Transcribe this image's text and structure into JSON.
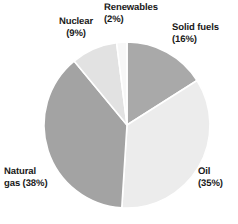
{
  "chart_data": {
    "type": "pie",
    "title": "",
    "subtitle": "",
    "xlabel": "",
    "ylabel": "",
    "legend_position": "none",
    "grid": false,
    "labels_outside": true,
    "start_angle_deg": 0,
    "direction": "clockwise",
    "categories": [
      "Solid fuels",
      "Oil",
      "Natural gas",
      "Nuclear",
      "Renewables"
    ],
    "values": [
      16,
      35,
      38,
      9,
      2
    ],
    "unit": "%",
    "slices": [
      {
        "name": "Solid fuels",
        "value": 16,
        "label": "Solid fuels\n(16%)",
        "label_name": "Solid fuels",
        "label_value": "(16%)",
        "color": "#a9a9a9"
      },
      {
        "name": "Oil",
        "value": 35,
        "label": "Oil\n(35%)",
        "label_name": "Oil",
        "label_value": "(35%)",
        "color": "#ececec"
      },
      {
        "name": "Natural gas",
        "value": 38,
        "label": "Natural\ngas (38%)",
        "label_name": "Natural gas",
        "label_value": "(38%)",
        "color": "#a3a3a3"
      },
      {
        "name": "Nuclear",
        "value": 9,
        "label": "Nuclear\n(9%)",
        "label_name": "Nuclear",
        "label_value": "(9%)",
        "color": "#e2e2e2"
      },
      {
        "name": "Renewables",
        "value": 2,
        "label": "Renewables\n(2%)",
        "label_name": "Renewables",
        "label_value": "(2%)",
        "color": "#f7f7f7"
      }
    ],
    "separator_color": "#ffffff",
    "background_color": "#ffffff",
    "text_color": "#1a1a1a"
  }
}
